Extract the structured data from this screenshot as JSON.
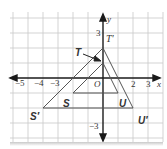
{
  "diagram": {
    "type": "coordinate-grid-dilation",
    "grid": {
      "x_min": -6,
      "x_max": 4,
      "y_min": -4,
      "y_max": 4,
      "unit_px": 15,
      "origin_px": [
        103,
        78
      ]
    },
    "axes": {
      "x_label": "x",
      "y_label": "y",
      "origin_label": "O",
      "x_ticks": [
        "−5",
        "−4",
        "−3",
        "2",
        "3"
      ],
      "y_ticks": [
        "3",
        "−3"
      ]
    },
    "triangles": [
      {
        "name": "TSU",
        "vertices": {
          "T": [
            0,
            1
          ],
          "S": [
            -2,
            -1
          ],
          "U": [
            1,
            -1
          ]
        }
      },
      {
        "name": "T'S'U'",
        "vertices": {
          "T'": [
            0,
            2
          ],
          "S'": [
            -4,
            -2
          ],
          "U'": [
            2,
            -2
          ]
        }
      }
    ],
    "labels": {
      "T": "T",
      "S": "S",
      "U": "U",
      "T_prime": "T′",
      "S_prime": "S′",
      "U_prime": "U′"
    },
    "colors": {
      "grid": "#c8c8c8",
      "axis": "#1a1a1a",
      "triangle": "#555555",
      "text": "#333333"
    }
  }
}
